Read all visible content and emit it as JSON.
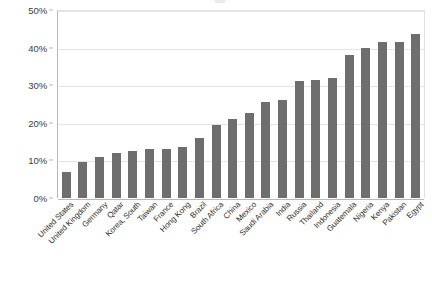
{
  "chart_data": {
    "type": "bar",
    "title": "",
    "xlabel": "",
    "ylabel": "",
    "ylim": [
      0,
      50
    ],
    "grid": true,
    "legend": null,
    "y_ticks": [
      "0%",
      "10%",
      "20%",
      "30%",
      "40%",
      "50%"
    ],
    "y_tick_values": [
      0,
      10,
      20,
      30,
      40,
      50
    ],
    "bar_color": "#6e6e6e",
    "categories": [
      "United States",
      "United Kingdom",
      "Germany",
      "Qatar",
      "Korea, South",
      "Taiwan",
      "France",
      "Hong Kong",
      "Brazil",
      "South Africa",
      "China",
      "Mexico",
      "Saudi Arabia",
      "India",
      "Russia",
      "Thailand",
      "Indonesia",
      "Guatemala",
      "Nigeria",
      "Kenya",
      "Pakistan",
      "Egypt"
    ],
    "values": [
      7,
      9.5,
      11,
      12,
      12.5,
      13,
      13,
      13.5,
      16,
      19.5,
      21,
      22.5,
      25.5,
      26,
      31,
      31.5,
      32,
      38,
      40,
      41.5,
      41.5,
      43.5
    ]
  }
}
